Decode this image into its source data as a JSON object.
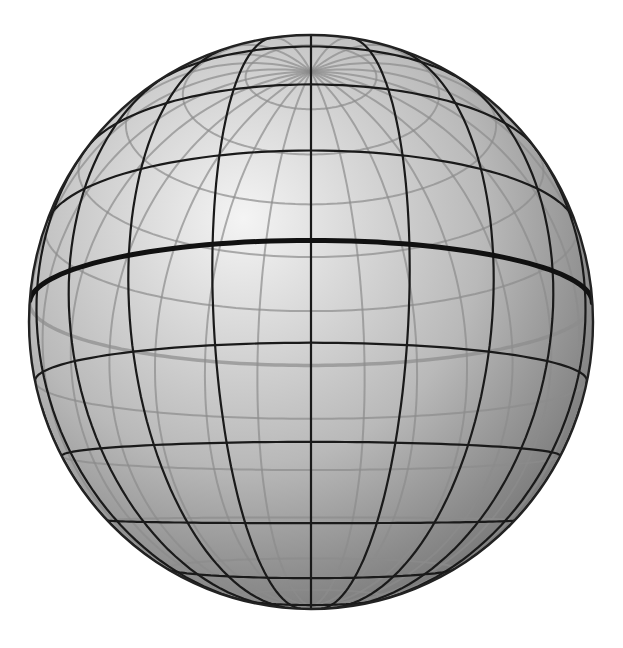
{
  "figure": {
    "clipped_caption_text": "",
    "background": "#ffffff"
  },
  "sphere": {
    "center": [
      311,
      322
    ],
    "radius_x": 282,
    "radius_y": 287,
    "tilt_deg": 12,
    "perspective_distance": 3.2,
    "shading": {
      "highlight_color": "#f4f4f4",
      "mid_color": "#b9b9b9",
      "shadow_color": "#6d6d6d",
      "highlight_pos": [
        0.38,
        0.32
      ]
    },
    "grid": {
      "meridian_step_deg": 15,
      "parallel_step_deg": 15,
      "front_line_color": "#1a1a1a",
      "front_line_width": 2.2,
      "back_line_color": "#8c8c8c",
      "back_line_width": 2,
      "equator_color": "#111111",
      "equator_width": 5,
      "outline_color": "#222222",
      "outline_width": 2.4
    }
  }
}
